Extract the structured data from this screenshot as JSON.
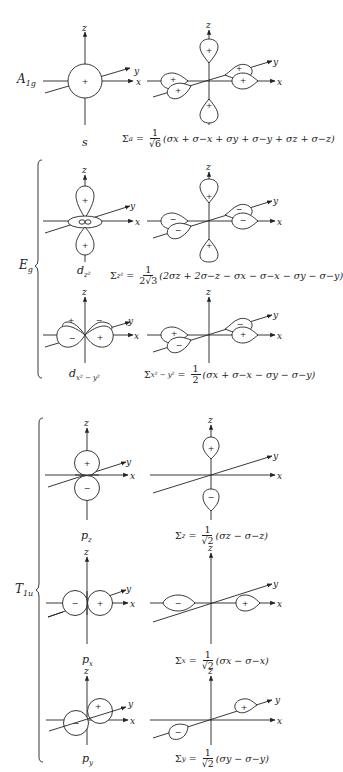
{
  "figure": {
    "axis_labels": {
      "x": "x",
      "y": "y",
      "z": "z"
    },
    "groups": [
      {
        "label": "A1g",
        "label_main": "A",
        "label_sub": "1g",
        "rows": [
          {
            "orbital": "s",
            "orbital_main": "s",
            "orbital_sub": "",
            "sign_center": "+",
            "salc_lobes": {
              "+z": "+",
              "-z": "+",
              "+x": "+",
              "-x": "+",
              "+y": "+",
              "-y": "+"
            },
            "formula": {
              "lhs_main": "Σ",
              "lhs_sub": "a",
              "eq": "=",
              "num": "1",
              "den": "√6",
              "rhs": "(σx + σ−x + σy + σ−y + σz + σ−z)"
            }
          }
        ]
      },
      {
        "label": "Eg",
        "label_main": "E",
        "label_sub": "g",
        "rows": [
          {
            "orbital": "dz2",
            "orbital_main": "d",
            "orbital_sub": "z²",
            "orbital_lobes": {
              "+z": "+",
              "-z": "+",
              "ring": "−"
            },
            "salc_lobes": {
              "+z": "+",
              "-z": "+",
              "+x": "−",
              "-x": "−",
              "+y": "−",
              "-y": "−"
            },
            "formula": {
              "lhs_main": "Σ",
              "lhs_sub": "z²",
              "eq": "=",
              "num": "1",
              "den": "2√3",
              "rhs": "(2σz + 2σ−z − σx − σ−x − σy − σ−y)"
            }
          },
          {
            "orbital": "dx2-y2",
            "orbital_main": "d",
            "orbital_sub": "x² − y²",
            "orbital_lobes": {
              "+x": "+",
              "-x": "+",
              "+y": "−",
              "-y": "−"
            },
            "salc_lobes": {
              "+x": "+",
              "-x": "+",
              "+y": "−",
              "-y": "−"
            },
            "formula": {
              "lhs_main": "Σ",
              "lhs_sub": "x² − y²",
              "eq": "=",
              "num": "1",
              "den": "2",
              "rhs": "(σx + σ−x − σy − σ−y)"
            }
          }
        ]
      },
      {
        "label": "T1u",
        "label_main": "T",
        "label_sub": "1u",
        "rows": [
          {
            "orbital": "pz",
            "orbital_main": "p",
            "orbital_sub": "z",
            "orbital_lobes": {
              "+z": "+",
              "-z": "−"
            },
            "salc_lobes": {
              "+z": "+",
              "-z": "−"
            },
            "formula": {
              "lhs_main": "Σ",
              "lhs_sub": "z",
              "eq": "=",
              "num": "1",
              "den": "√2",
              "rhs": "(σz − σ−z)"
            }
          },
          {
            "orbital": "px",
            "orbital_main": "p",
            "orbital_sub": "x",
            "orbital_lobes": {
              "+x": "+",
              "-x": "−"
            },
            "salc_lobes": {
              "+x": "+",
              "-x": "−"
            },
            "formula": {
              "lhs_main": "Σ",
              "lhs_sub": "x",
              "eq": "=",
              "num": "1",
              "den": "√2",
              "rhs": "(σx − σ−x)"
            }
          },
          {
            "orbital": "py",
            "orbital_main": "p",
            "orbital_sub": "y",
            "orbital_lobes": {
              "+y": "+",
              "-y": "−"
            },
            "salc_lobes": {
              "+y": "+",
              "-y": "−"
            },
            "formula": {
              "lhs_main": "Σ",
              "lhs_sub": "y",
              "eq": "=",
              "num": "1",
              "den": "√2",
              "rhs": "(σy − σ−y)"
            }
          }
        ]
      }
    ],
    "colors": {
      "ink": "#222222",
      "background": "#ffffff"
    }
  }
}
